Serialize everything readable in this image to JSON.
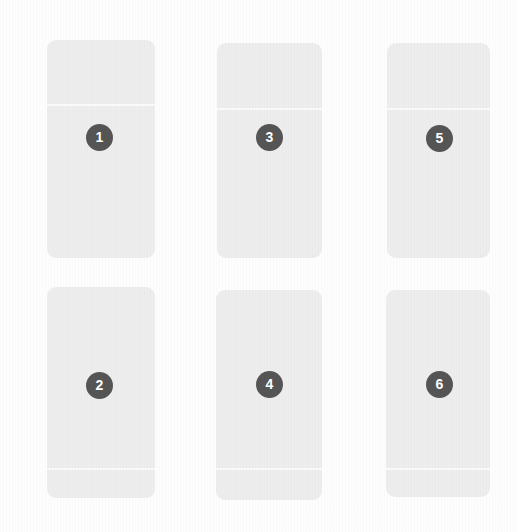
{
  "canvas": {
    "width": 517,
    "height": 532,
    "background_color": "#fdfdfd"
  },
  "theme": {
    "panel_color": "#ededed",
    "panel_rule_color": "#fafafa",
    "badge_color": "#555555",
    "badge_text_color": "#ffffff",
    "panel_radius_px": 9
  },
  "grid": {
    "columns": 3,
    "rows": 2,
    "panel_width": 104,
    "panel_height": 216,
    "column_x": [
      47,
      217,
      387
    ],
    "row_y": [
      40,
      287
    ],
    "column_gap": 66,
    "row_gap": 31
  },
  "panels": [
    {
      "id": "panel-1",
      "number": "1",
      "column": 1,
      "row": 1,
      "x": 47,
      "y": 40,
      "width": 108,
      "height": 218,
      "rule_offset": 64,
      "badge_x": 86,
      "badge_y": 124
    },
    {
      "id": "panel-2",
      "number": "2",
      "column": 1,
      "row": 2,
      "x": 47,
      "y": 287,
      "width": 108,
      "height": 211,
      "rule_offset": 181,
      "badge_x": 86,
      "badge_y": 372
    },
    {
      "id": "panel-3",
      "number": "3",
      "column": 2,
      "row": 1,
      "x": 217,
      "y": 43,
      "width": 105,
      "height": 215,
      "rule_offset": 65,
      "badge_x": 256,
      "badge_y": 124
    },
    {
      "id": "panel-4",
      "number": "4",
      "column": 2,
      "row": 2,
      "x": 216,
      "y": 290,
      "width": 106,
      "height": 210,
      "rule_offset": 178,
      "badge_x": 256,
      "badge_y": 371
    },
    {
      "id": "panel-5",
      "number": "5",
      "column": 3,
      "row": 1,
      "x": 387,
      "y": 43,
      "width": 103,
      "height": 215,
      "rule_offset": 65,
      "badge_x": 426,
      "badge_y": 125
    },
    {
      "id": "panel-6",
      "number": "6",
      "column": 3,
      "row": 2,
      "x": 386,
      "y": 290,
      "width": 104,
      "height": 207,
      "rule_offset": 178,
      "badge_x": 426,
      "badge_y": 371
    }
  ]
}
